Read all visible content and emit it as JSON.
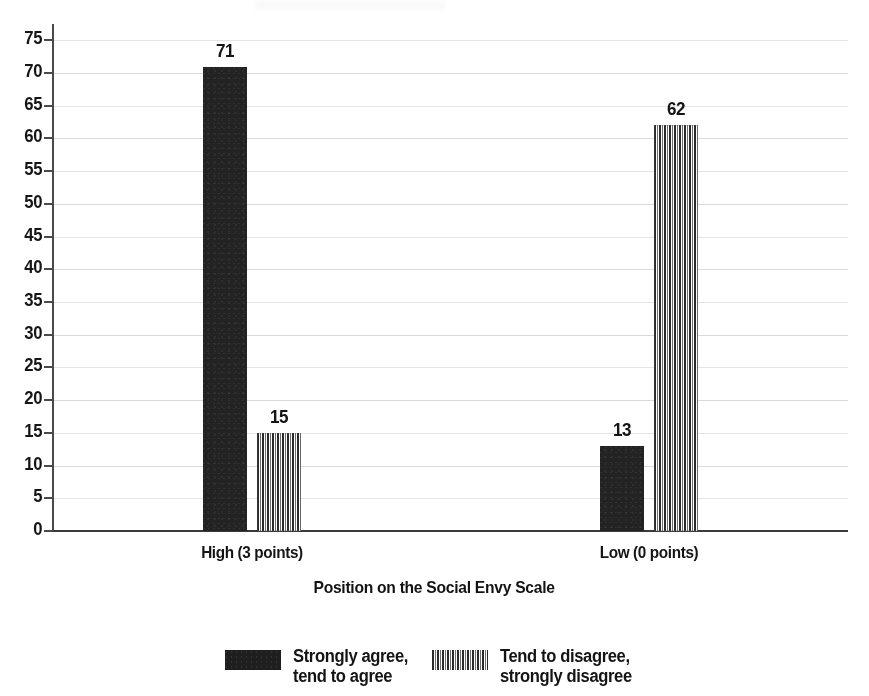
{
  "chart_data": {
    "type": "bar",
    "title": "",
    "xlabel": "Position on the Social Envy Scale",
    "ylabel": "",
    "categories": [
      "High (3 points)",
      "Low (0 points)"
    ],
    "series": [
      {
        "name": "Strongly agree,\ntend to agree",
        "values": [
          71,
          13
        ],
        "pattern": "solid",
        "color": "#232323"
      },
      {
        "name": "Tend to disagree,\nstrongly disagree",
        "values": [
          15,
          62
        ],
        "pattern": "vertical-stripes",
        "color": "#2b2b2b"
      }
    ],
    "ylim": [
      0,
      75
    ],
    "ytick_step": 5,
    "yticks": [
      0,
      5,
      10,
      15,
      20,
      25,
      30,
      35,
      40,
      45,
      50,
      55,
      60,
      65,
      70,
      75
    ],
    "grid": true,
    "grid_color": "#d9dadb",
    "legend_position": "bottom",
    "data_labels": [
      71,
      15,
      13,
      62
    ],
    "background": "#ffffff",
    "axis_color": "#3b3b3b"
  },
  "axis": {
    "x_title": "Position on the Social Envy Scale"
  },
  "legend": {
    "items": [
      {
        "label": "Strongly agree,\ntend to agree",
        "swatch": "solid-black-swatch"
      },
      {
        "label": "Tend to disagree,\nstrongly disagree",
        "swatch": "striped-swatch"
      }
    ]
  }
}
